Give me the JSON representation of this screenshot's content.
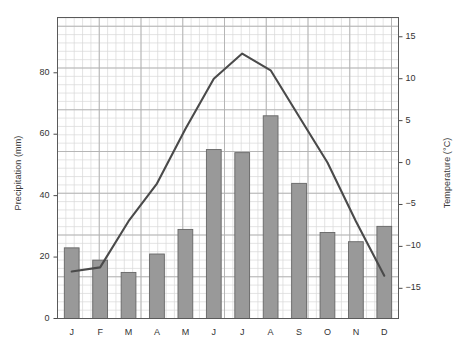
{
  "chart_data": {
    "type": "bar",
    "title": "",
    "subtitle": "",
    "categories": [
      "J",
      "F",
      "M",
      "A",
      "M",
      "J",
      "J",
      "A",
      "S",
      "O",
      "N",
      "D"
    ],
    "xlabel": "",
    "ylabel": "Precipitation (mm)",
    "y2label": "Temperature (°C)",
    "ylim": [
      0,
      98
    ],
    "y2lim": [
      -18.6,
      17.3
    ],
    "yticks": [
      0,
      20,
      40,
      60,
      80
    ],
    "ytick_labels": [
      "0",
      "20",
      "40",
      "60",
      "80"
    ],
    "y2ticks": [
      -15,
      -10,
      -5,
      0,
      5,
      10,
      15
    ],
    "y2tick_labels": [
      "−15",
      "−10",
      "−5",
      "0",
      "5",
      "10",
      "15"
    ],
    "grid": true,
    "grid_minor": true,
    "legend": "none",
    "series": [
      {
        "name": "Precipitation",
        "type": "bar",
        "axis": "left",
        "unit": "mm",
        "color": "#999999",
        "edge_color": "#666666",
        "values": [
          23,
          19,
          15,
          21,
          29,
          55,
          54,
          66,
          44,
          28,
          25,
          30
        ]
      },
      {
        "name": "Temperature",
        "type": "line",
        "axis": "right",
        "unit": "°C",
        "color": "#4a4a4a",
        "values": [
          -13.0,
          -12.5,
          -7.0,
          -2.5,
          4.0,
          10.0,
          13.0,
          11.0,
          5.5,
          0.0,
          -7.0,
          -13.5
        ]
      }
    ]
  },
  "axes": {
    "left_title": "Precipitation (mm)",
    "right_title": "Temperature (°C)"
  }
}
